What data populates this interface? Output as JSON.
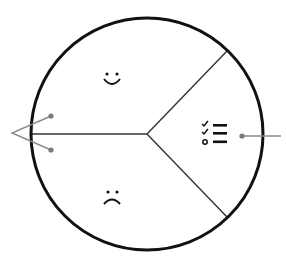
{
  "diagram": {
    "type": "circle-divided-into-three-sectors",
    "colors": {
      "outline": "#111111",
      "spoke": "#333333",
      "connector": "#888888",
      "background": "#ffffff"
    },
    "sectors": [
      {
        "id": "top-left",
        "icon": "smiley-face-icon",
        "glyph": "happy face"
      },
      {
        "id": "bottom-left",
        "icon": "frowning-face-icon",
        "glyph": "sad face"
      },
      {
        "id": "right",
        "icon": "checklist-icon",
        "glyph": "checklist with two checks and one open item"
      }
    ],
    "connectors": {
      "left": "two dotted lines converging to a point outside the circle on the left",
      "right": "single line with dot extending out of the circle on the right"
    }
  }
}
